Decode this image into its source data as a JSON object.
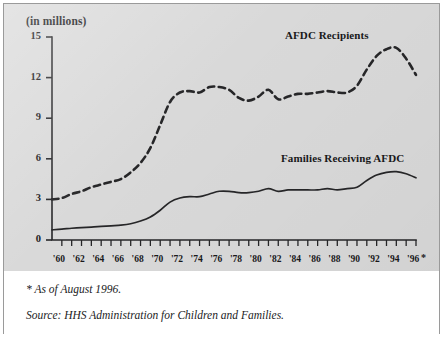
{
  "figure": {
    "axis_title": "(in millions)",
    "footnote": "* As of August 1996.",
    "source": "Source: HHS Administration for Children and Families.",
    "panel_bg": "#d9d9d9",
    "line_color": "#262628"
  },
  "labels": {
    "recipients": "AFDC Recipients",
    "families": "Families Receiving AFDC",
    "x_star": "*"
  },
  "chart_data": {
    "type": "line",
    "title": "",
    "subtitle": "",
    "xlabel": "",
    "ylabel": "(in millions)",
    "ylim": [
      0,
      15
    ],
    "xlim": [
      1959,
      1996
    ],
    "yticks": [
      0,
      3,
      6,
      9,
      12,
      15
    ],
    "ytick_labels": [
      "0",
      "3",
      "6",
      "9",
      "12",
      "15"
    ],
    "xticks": [
      1960,
      1962,
      1964,
      1966,
      1968,
      1970,
      1972,
      1974,
      1976,
      1978,
      1980,
      1982,
      1984,
      1986,
      1988,
      1990,
      1992,
      1994,
      1996
    ],
    "xtick_labels": [
      "'60",
      "'62",
      "'64",
      "'66",
      "'68",
      "'70",
      "'72",
      "'74",
      "'76",
      "'78",
      "'80",
      "'82",
      "'84",
      "'86",
      "'88",
      "'90",
      "'92",
      "'94",
      "'96"
    ],
    "minor_xticks_every": 1,
    "grid": false,
    "legend": "inline-annotations",
    "x": [
      1959,
      1960,
      1961,
      1962,
      1963,
      1964,
      1965,
      1966,
      1967,
      1968,
      1969,
      1970,
      1971,
      1972,
      1973,
      1974,
      1975,
      1976,
      1977,
      1978,
      1979,
      1980,
      1981,
      1982,
      1983,
      1984,
      1985,
      1986,
      1987,
      1988,
      1989,
      1990,
      1991,
      1992,
      1993,
      1994,
      1995,
      1996
    ],
    "series": [
      {
        "name": "AFDC Recipients",
        "style": "dashed",
        "values": [
          3.0,
          3.1,
          3.4,
          3.6,
          3.9,
          4.1,
          4.3,
          4.5,
          5.0,
          5.7,
          6.8,
          8.5,
          10.2,
          10.9,
          11.0,
          10.9,
          11.3,
          11.3,
          11.1,
          10.5,
          10.3,
          10.6,
          11.1,
          10.4,
          10.6,
          10.8,
          10.8,
          10.9,
          11.0,
          10.9,
          10.9,
          11.4,
          12.6,
          13.6,
          14.1,
          14.2,
          13.4,
          12.2
        ]
      },
      {
        "name": "Families Receiving AFDC",
        "style": "solid",
        "values": [
          0.75,
          0.8,
          0.87,
          0.92,
          0.95,
          1.0,
          1.05,
          1.1,
          1.2,
          1.4,
          1.7,
          2.2,
          2.8,
          3.1,
          3.2,
          3.2,
          3.4,
          3.6,
          3.6,
          3.5,
          3.5,
          3.6,
          3.8,
          3.6,
          3.7,
          3.7,
          3.7,
          3.7,
          3.8,
          3.7,
          3.8,
          3.9,
          4.4,
          4.8,
          5.0,
          5.05,
          4.9,
          4.6
        ]
      }
    ]
  }
}
